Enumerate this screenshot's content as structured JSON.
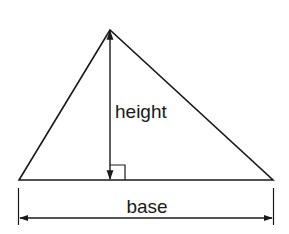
{
  "diagram": {
    "type": "triangle-area",
    "labels": {
      "height": "height",
      "base": "base"
    },
    "colors": {
      "stroke": "#1a1a1a",
      "background": "#ffffff"
    }
  }
}
